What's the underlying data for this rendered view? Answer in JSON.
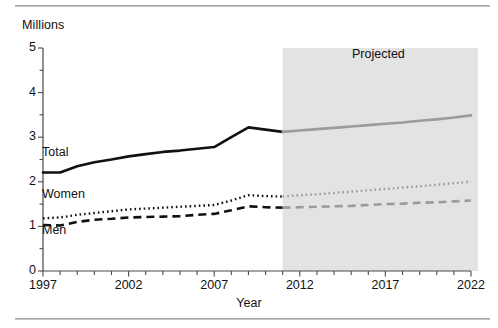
{
  "chart_data": {
    "type": "line",
    "title": "",
    "xlabel": "Year",
    "ylabel": "",
    "unit_label": "Millions",
    "xlim": [
      1997,
      2022
    ],
    "ylim": [
      0,
      5
    ],
    "yticks": [
      0,
      1,
      2,
      3,
      4,
      5
    ],
    "ytick_labels": [
      "0",
      "1",
      "2",
      "3",
      "4",
      "5"
    ],
    "y_minor_tick_step": 0.5,
    "xticks": [
      1997,
      2002,
      2007,
      2012,
      2017,
      2022
    ],
    "xtick_labels": [
      "1997",
      "2002",
      "2007",
      "2012",
      "2017",
      "2022"
    ],
    "x_minor_tick_step": 1,
    "grid": false,
    "legend": "inline-labels",
    "annotations": [
      {
        "text": "Projected",
        "x": 2016.5,
        "y": 4.6
      }
    ],
    "shaded_region": {
      "label": "Projected",
      "x_start": 2011,
      "x_end": 2022.4,
      "color": "#e3e3e3"
    },
    "x": [
      1997,
      1998,
      1999,
      2000,
      2001,
      2002,
      2003,
      2004,
      2005,
      2006,
      2007,
      2008,
      2009,
      2010,
      2011,
      2012,
      2013,
      2014,
      2015,
      2016,
      2017,
      2018,
      2019,
      2020,
      2021,
      2022
    ],
    "series": [
      {
        "name": "Total",
        "style": "solid",
        "color_historical": "#111111",
        "color_projected": "#9b9b9b",
        "values": [
          2.21,
          2.21,
          2.35,
          2.44,
          2.5,
          2.57,
          2.62,
          2.67,
          2.7,
          2.74,
          2.78,
          3.0,
          3.22,
          3.17,
          3.12,
          3.15,
          3.18,
          3.21,
          3.24,
          3.27,
          3.3,
          3.33,
          3.37,
          3.4,
          3.44,
          3.49
        ]
      },
      {
        "name": "Women",
        "style": "dotted",
        "color_historical": "#111111",
        "color_projected": "#9b9b9b",
        "values": [
          1.18,
          1.2,
          1.26,
          1.3,
          1.34,
          1.38,
          1.4,
          1.42,
          1.44,
          1.46,
          1.48,
          1.58,
          1.7,
          1.68,
          1.67,
          1.7,
          1.72,
          1.75,
          1.78,
          1.81,
          1.84,
          1.87,
          1.9,
          1.93,
          1.97,
          2.0
        ]
      },
      {
        "name": "Men",
        "style": "dashed",
        "color_historical": "#111111",
        "color_projected": "#9b9b9b",
        "values": [
          1.03,
          1.02,
          1.1,
          1.15,
          1.17,
          1.2,
          1.21,
          1.22,
          1.23,
          1.26,
          1.28,
          1.36,
          1.45,
          1.43,
          1.42,
          1.43,
          1.44,
          1.45,
          1.46,
          1.48,
          1.5,
          1.51,
          1.53,
          1.54,
          1.56,
          1.58
        ]
      }
    ],
    "series_label_positions": [
      {
        "name": "Total",
        "left": 42,
        "top": 145
      },
      {
        "name": "Women",
        "left": 42,
        "top": 187
      },
      {
        "name": "Men",
        "left": 42,
        "top": 223
      }
    ]
  }
}
